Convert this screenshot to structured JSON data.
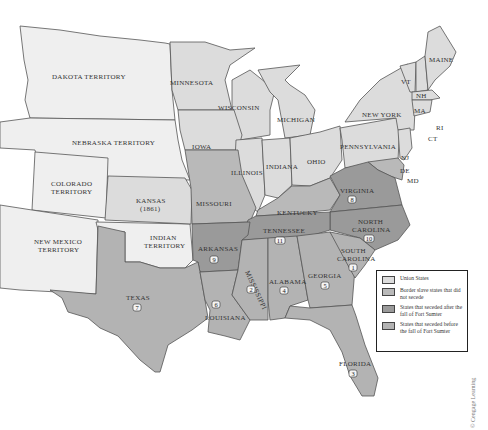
{
  "map": {
    "labels": {
      "dakota": "DAKOTA TERRITORY",
      "nebraska": "NEBRASKA TERRITORY",
      "colorado_1": "COLORADO",
      "colorado_2": "TERRITORY",
      "new_mexico_1": "NEW MEXICO",
      "new_mexico_2": "TERRITORY",
      "kansas_1": "KANSAS",
      "kansas_2": "(1861)",
      "indian_1": "INDIAN",
      "indian_2": "TERRITORY",
      "minnesota": "MINNESOTA",
      "wisconsin": "WISCONSIN",
      "michigan": "MICHIGAN",
      "iowa": "IOWA",
      "illinois": "ILLINOIS",
      "indiana": "INDIANA",
      "ohio": "OHIO",
      "pennsylvania": "PENNSYLVANIA",
      "new_york": "NEW YORK",
      "maine": "MAINE",
      "vt": "VT",
      "nh": "NH",
      "ma": "MA",
      "ri": "RI",
      "ct": "CT",
      "nj": "NJ",
      "de": "DE",
      "md": "MD",
      "missouri": "MISSOURI",
      "kentucky": "KENTUCKY",
      "virginia": "VIRGINIA",
      "north_carolina_1": "NORTH",
      "north_carolina_2": "CAROLINA",
      "tennessee": "TENNESSEE",
      "arkansas": "ARKANSAS",
      "south_carolina_1": "SOUTH",
      "south_carolina_2": "CAROLINA",
      "mississippi": "MISSISSIPPI",
      "alabama": "ALABAMA",
      "georgia": "GEORGIA",
      "louisiana": "LOUISIANA",
      "texas": "TEXAS",
      "florida": "FLORIDA"
    },
    "secession_order": {
      "south_carolina": "1",
      "mississippi": "2",
      "florida": "3",
      "alabama": "4",
      "georgia": "5",
      "louisiana": "6",
      "texas": "7",
      "virginia": "8",
      "arkansas": "9",
      "north_carolina": "10",
      "tennessee": "11"
    },
    "colors": {
      "union": "#dcdcdc",
      "territory": "#efefef",
      "border_slave": "#b9b9b9",
      "seceded_after": "#9a9a9a",
      "seceded_before": "#b3b3b3"
    }
  },
  "legend": {
    "items": [
      {
        "label": "Union States",
        "color": "#dcdcdc"
      },
      {
        "label": "Border slave states that did not secede",
        "color": "#b9b9b9"
      },
      {
        "label": "States that seceded after the fall of Fort Sumter",
        "color": "#9a9a9a"
      },
      {
        "label": "States that seceded before the fall of Fort Sumter",
        "color": "#b3b3b3"
      }
    ]
  },
  "credit": "© Cengage Learning"
}
